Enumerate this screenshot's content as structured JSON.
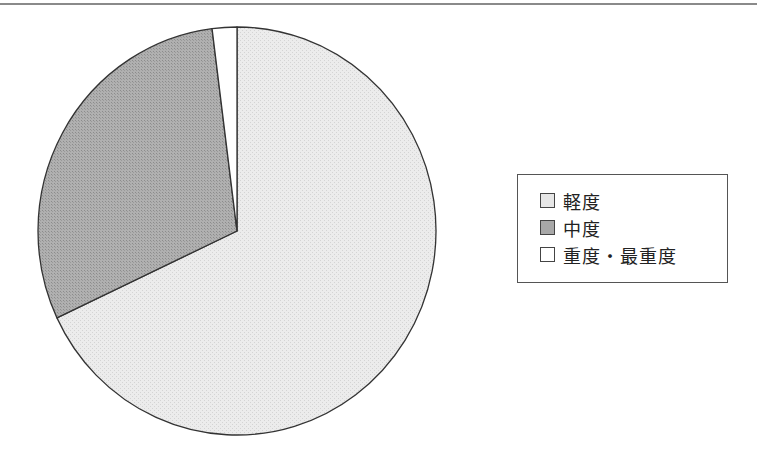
{
  "chart_data": {
    "type": "pie",
    "title": "",
    "categories": [
      "軽度",
      "中度",
      "重度・最重度"
    ],
    "values": [
      68,
      30,
      2
    ],
    "unit": "%",
    "colors": [
      "#e6e6e6",
      "#a8a8a8",
      "#ffffff"
    ],
    "start_angle_deg": 0,
    "direction": "clockwise",
    "legend_position": "right",
    "data_labels": false
  },
  "legend": {
    "items": [
      {
        "label": "軽度",
        "color": "#e6e6e6"
      },
      {
        "label": "中度",
        "color": "#a8a8a8"
      },
      {
        "label": "重度・最重度",
        "color": "#ffffff"
      }
    ]
  }
}
